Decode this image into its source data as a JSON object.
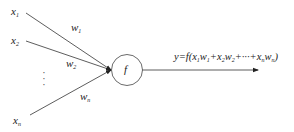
{
  "diagram": {
    "inputs": [
      {
        "name": "x",
        "sub": "1",
        "weight_name": "w",
        "weight_sub": "1"
      },
      {
        "name": "x",
        "sub": "2",
        "weight_name": "w",
        "weight_sub": "2"
      },
      {
        "name": "x",
        "sub": "n",
        "weight_name": "w",
        "weight_sub": "n"
      }
    ],
    "ellipsis": "⋮",
    "node": {
      "label": "f"
    },
    "output": {
      "prefix": "y=f(",
      "terms": [
        {
          "x": "x",
          "xs": "1",
          "w": "w",
          "ws": "1"
        },
        {
          "x": "x",
          "xs": "2",
          "w": "w",
          "ws": "2"
        },
        {
          "x": "x",
          "xs": "n",
          "w": "w",
          "ws": "n"
        }
      ],
      "plus": "+",
      "ellipsis": "···",
      "suffix": ")"
    },
    "colors": {
      "line": "#333333",
      "text": "#222222",
      "background": "#ffffff"
    }
  }
}
